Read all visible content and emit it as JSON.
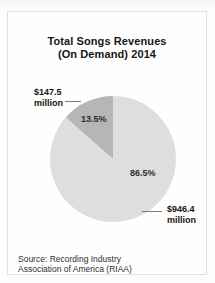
{
  "card": {
    "title_line1": "Total Songs Revenues",
    "title_line2": "(On Demand) 2014",
    "source_line1": "Source: Recording Industry",
    "source_line2": "Association of America (RIAA)"
  },
  "labels": {
    "small_slice_value": "$147.5",
    "small_slice_unit": "million",
    "small_slice_pct": "13.5%",
    "large_slice_value": "$946.4",
    "large_slice_unit": "million",
    "large_slice_pct": "86.5%"
  },
  "colors": {
    "large_slice": "#dedede",
    "small_slice": "#b6b6b6",
    "card_border": "#e0e0e0",
    "text": "#161616"
  },
  "chart_data": {
    "type": "pie",
    "title": "Total Songs Revenues (On Demand) 2014",
    "slices": [
      {
        "name": "large",
        "label": "$946.4 million",
        "percent": 86.5,
        "value_million_usd": 946.4,
        "color": "#dedede"
      },
      {
        "name": "small",
        "label": "$147.5 million",
        "percent": 13.5,
        "value_million_usd": 147.5,
        "color": "#b6b6b6"
      }
    ],
    "start_angle_deg": 0,
    "direction": "clockwise",
    "legend": "none",
    "source": "Source: Recording Industry Association of America (RIAA)"
  }
}
